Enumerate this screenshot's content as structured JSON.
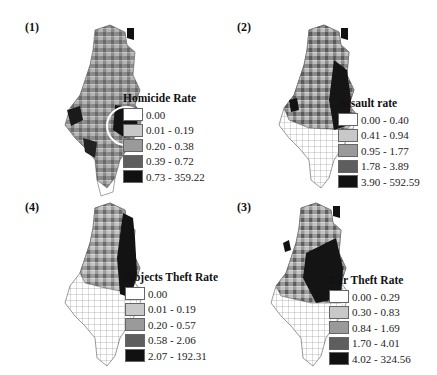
{
  "figure": {
    "panels": [
      {
        "label": "(1)",
        "legend": {
          "title": "Homicide Rate",
          "classes": [
            "0.00",
            "0.01 - 0.19",
            "0.20 - 0.38",
            "0.39 - 0.72",
            "0.73 - 359.22"
          ]
        },
        "highlight": "circle around central dark cluster"
      },
      {
        "label": "(2)",
        "legend": {
          "title": "Assault rate",
          "classes": [
            "0.00 - 0.40",
            "0.41 - 0.94",
            "0.95 - 1.77",
            "1.78 - 3.89",
            "3.90 - 592.59"
          ]
        }
      },
      {
        "label": "(4)",
        "legend": {
          "title": "Objects Theft Rate",
          "classes": [
            "0.00",
            "0.01 - 0.19",
            "0.20 - 0.57",
            "0.58 - 2.06",
            "2.07 - 192.31"
          ]
        }
      },
      {
        "label": "(3)",
        "legend": {
          "title": "Car Theft Rate",
          "classes": [
            "0.00 - 0.29",
            "0.30 - 0.83",
            "0.84 - 1.69",
            "1.70 - 4.01",
            "4.02 - 324.56"
          ]
        }
      }
    ],
    "class_colors": [
      "#ffffff",
      "#c8c8c8",
      "#9a9a9a",
      "#5e5e5e",
      "#111111"
    ]
  }
}
